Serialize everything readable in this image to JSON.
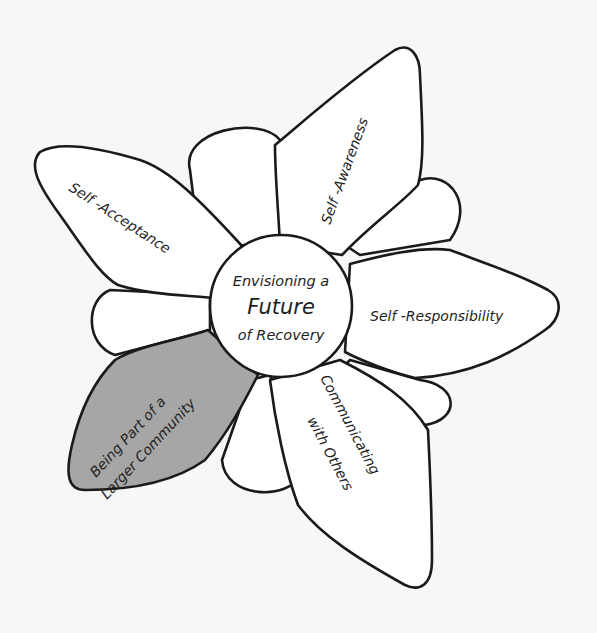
{
  "diagram": {
    "type": "flower",
    "center": {
      "line1": "Envisioning a",
      "line2": "Future",
      "line3": "of Recovery"
    },
    "petals": [
      {
        "id": "self-awareness",
        "label": "Self -Awareness",
        "highlighted": false
      },
      {
        "id": "self-acceptance",
        "label": "Self -Acceptance",
        "highlighted": false
      },
      {
        "id": "self-responsibility",
        "label": "Self -Responsibility",
        "highlighted": false
      },
      {
        "id": "being-part",
        "line1": "Being Part of a",
        "line2": "Larger Community",
        "highlighted": true
      },
      {
        "id": "communicating",
        "line1": "Communicating",
        "line2": "with Others",
        "highlighted": false
      }
    ],
    "colors": {
      "background": "#f7f7f5",
      "petal_fill": "#ffffff",
      "highlight_fill": "#a6a6a6",
      "stroke": "#1a1a1a"
    }
  }
}
